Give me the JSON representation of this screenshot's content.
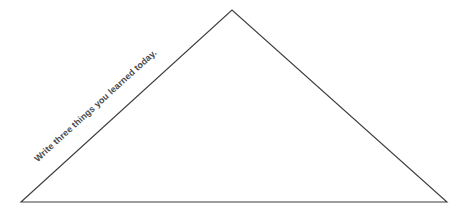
{
  "page": {
    "background_color": "#ffffff",
    "width": 463,
    "height": 214
  },
  "shape": {
    "name": "triangle",
    "type": "triangle",
    "stroke_color": "#3d3d3d",
    "fill_color": "none",
    "stroke_width": 1.1,
    "vertices": [
      {
        "label": "bottom-left",
        "x": 21,
        "y": 202
      },
      {
        "label": "apex",
        "x": 232,
        "y": 10
      },
      {
        "label": "bottom-right",
        "x": 447,
        "y": 202
      }
    ]
  },
  "annotations": {
    "prompt": {
      "text": "Write three things you learned today.",
      "color": "#4a4a4a",
      "rotation_degrees": -42.3,
      "anchor_x": 33,
      "anchor_y": 157,
      "placement": "along-left-edge"
    }
  }
}
